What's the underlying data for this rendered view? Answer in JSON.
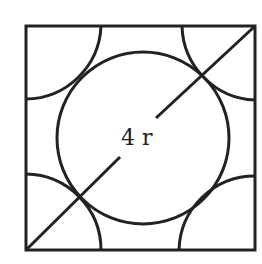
{
  "diagram": {
    "label": "4 r",
    "stroke_color": "#222222",
    "square": {
      "x": 26,
      "y": 26,
      "w": 229,
      "h": 224
    },
    "center_circle": {
      "cx": 143,
      "cy": 138,
      "r": 86
    },
    "corner_arc_radius": 76
  }
}
